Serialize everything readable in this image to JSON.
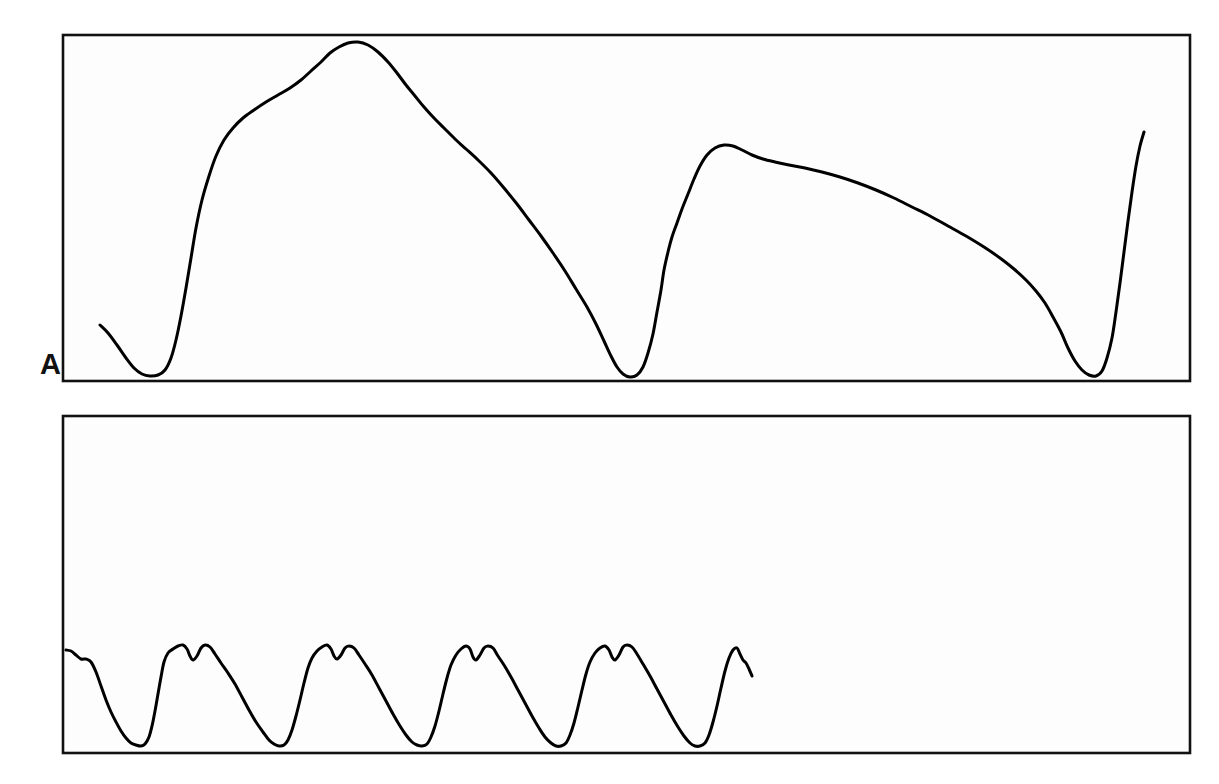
{
  "figure": {
    "kind": "physiological-strip-chart",
    "background_color": "#ffffff",
    "width": 1219,
    "height": 784,
    "grid_minor_color": "#3a3a3a",
    "grid_major_color": "#111111",
    "trace_color": "#000000"
  },
  "panels": [
    {
      "id": "A",
      "label": "A",
      "plot_box": {
        "x": 63,
        "y": 35,
        "width": 1127,
        "height": 346
      },
      "grid": {
        "minor_step_x": 9.4,
        "minor_step_y": 9.6,
        "major_every": 5,
        "minor_cols": 120,
        "minor_rows": 36
      }
    },
    {
      "id": "B",
      "label": "B",
      "plot_box": {
        "x": 63,
        "y": 416,
        "width": 1127,
        "height": 337
      },
      "grid": {
        "minor_step_x": 9.4,
        "minor_step_y": 9.35,
        "major_every": 5,
        "minor_cols": 120,
        "minor_rows": 36
      }
    }
  ],
  "chart_data": {
    "type": "line",
    "title": "",
    "subtitle": "",
    "xlabel": "",
    "ylabel": "",
    "grid": true,
    "legend": "none",
    "panel_labels": [
      "A",
      "B"
    ],
    "charts": [
      {
        "panel": "A",
        "type": "line",
        "name": "Slow low-frequency trace (panel A)",
        "xlim": [
          63,
          1190
        ],
        "ylim": [
          35,
          381
        ],
        "description": "Single continuous slow-wave trace with a low trough near the left, a broad high plateau peak, a deep sharp trough at mid-record, a secondary rounded peak, a long gradual decline, a deep sharp trough near the right, and a steep terminal upstroke.",
        "points": [
          [
            100,
            325
          ],
          [
            108,
            333
          ],
          [
            117,
            345
          ],
          [
            126,
            358
          ],
          [
            134,
            368
          ],
          [
            142,
            374
          ],
          [
            150,
            376
          ],
          [
            158,
            375
          ],
          [
            165,
            370
          ],
          [
            171,
            358
          ],
          [
            176,
            340
          ],
          [
            181,
            316
          ],
          [
            186,
            288
          ],
          [
            191,
            258
          ],
          [
            196,
            228
          ],
          [
            202,
            200
          ],
          [
            209,
            176
          ],
          [
            216,
            156
          ],
          [
            224,
            140
          ],
          [
            233,
            128
          ],
          [
            243,
            118
          ],
          [
            254,
            110
          ],
          [
            266,
            102
          ],
          [
            278,
            95
          ],
          [
            290,
            88
          ],
          [
            301,
            80
          ],
          [
            311,
            71
          ],
          [
            321,
            62
          ],
          [
            330,
            53
          ],
          [
            339,
            47
          ],
          [
            348,
            43
          ],
          [
            358,
            42
          ],
          [
            368,
            45
          ],
          [
            378,
            52
          ],
          [
            388,
            62
          ],
          [
            397,
            73
          ],
          [
            406,
            85
          ],
          [
            415,
            96
          ],
          [
            424,
            107
          ],
          [
            434,
            118
          ],
          [
            444,
            128
          ],
          [
            455,
            139
          ],
          [
            466,
            149
          ],
          [
            478,
            160
          ],
          [
            491,
            173
          ],
          [
            504,
            188
          ],
          [
            517,
            204
          ],
          [
            529,
            220
          ],
          [
            541,
            236
          ],
          [
            553,
            253
          ],
          [
            565,
            271
          ],
          [
            576,
            289
          ],
          [
            587,
            307
          ],
          [
            596,
            324
          ],
          [
            604,
            341
          ],
          [
            611,
            356
          ],
          [
            617,
            367
          ],
          [
            623,
            374
          ],
          [
            630,
            377
          ],
          [
            637,
            375
          ],
          [
            643,
            367
          ],
          [
            648,
            353
          ],
          [
            653,
            334
          ],
          [
            657,
            312
          ],
          [
            661,
            290
          ],
          [
            664,
            270
          ],
          [
            668,
            252
          ],
          [
            672,
            237
          ],
          [
            677,
            223
          ],
          [
            682,
            209
          ],
          [
            688,
            194
          ],
          [
            694,
            179
          ],
          [
            700,
            166
          ],
          [
            707,
            155
          ],
          [
            715,
            148
          ],
          [
            724,
            145
          ],
          [
            733,
            146
          ],
          [
            742,
            150
          ],
          [
            752,
            155
          ],
          [
            763,
            159
          ],
          [
            775,
            162
          ],
          [
            789,
            165
          ],
          [
            805,
            168
          ],
          [
            822,
            172
          ],
          [
            840,
            177
          ],
          [
            858,
            183
          ],
          [
            876,
            190
          ],
          [
            894,
            198
          ],
          [
            912,
            207
          ],
          [
            930,
            216
          ],
          [
            948,
            226
          ],
          [
            966,
            236
          ],
          [
            984,
            247
          ],
          [
            1000,
            258
          ],
          [
            1014,
            269
          ],
          [
            1026,
            280
          ],
          [
            1036,
            291
          ],
          [
            1045,
            303
          ],
          [
            1053,
            317
          ],
          [
            1061,
            332
          ],
          [
            1068,
            348
          ],
          [
            1075,
            361
          ],
          [
            1082,
            370
          ],
          [
            1089,
            375
          ],
          [
            1096,
            376
          ],
          [
            1102,
            371
          ],
          [
            1107,
            358
          ],
          [
            1112,
            338
          ],
          [
            1116,
            312
          ],
          [
            1120,
            283
          ],
          [
            1124,
            252
          ],
          [
            1128,
            221
          ],
          [
            1132,
            192
          ],
          [
            1136,
            166
          ],
          [
            1140,
            146
          ],
          [
            1144,
            132
          ]
        ]
      },
      {
        "panel": "B",
        "type": "line",
        "name": "Fast pulsatile trace (panel B)",
        "xlim": [
          63,
          1190
        ],
        "ylim": [
          416,
          753
        ],
        "description": "Repeating pulsatile waveform, about 9 full cycles, each with a broad twin-peaked (dicrotic-notched) systolic plateau near y=650 and a sharp trough near y=745. Trace stops at roughly x=752 leaving the right third of the grid blank.",
        "cycle_period_px": 77,
        "cycle_count": 9,
        "peak_y": 648,
        "trough_y": 745,
        "trace_end_x": 752,
        "points": [
          [
            66,
            650
          ],
          [
            71,
            651
          ],
          [
            76,
            655
          ],
          [
            81,
            659
          ],
          [
            86,
            659
          ],
          [
            91,
            662
          ],
          [
            96,
            672
          ],
          [
            101,
            686
          ],
          [
            106,
            700
          ],
          [
            111,
            712
          ],
          [
            116,
            722
          ],
          [
            121,
            731
          ],
          [
            126,
            738
          ],
          [
            131,
            743
          ],
          [
            136,
            745
          ],
          [
            141,
            746
          ],
          [
            145,
            744
          ],
          [
            149,
            737
          ],
          [
            152,
            726
          ],
          [
            155,
            711
          ],
          [
            158,
            694
          ],
          [
            161,
            677
          ],
          [
            164,
            662
          ],
          [
            168,
            653
          ],
          [
            173,
            649
          ],
          [
            178,
            646
          ],
          [
            183,
            645
          ],
          [
            187,
            649
          ],
          [
            190,
            656
          ],
          [
            193,
            660
          ],
          [
            197,
            656
          ],
          [
            201,
            648
          ],
          [
            205,
            645
          ],
          [
            210,
            647
          ],
          [
            215,
            654
          ],
          [
            221,
            663
          ],
          [
            228,
            673
          ],
          [
            235,
            684
          ],
          [
            242,
            697
          ],
          [
            249,
            710
          ],
          [
            256,
            722
          ],
          [
            263,
            732
          ],
          [
            269,
            740
          ],
          [
            274,
            744
          ],
          [
            279,
            746
          ],
          [
            284,
            745
          ],
          [
            288,
            740
          ],
          [
            292,
            730
          ],
          [
            296,
            716
          ],
          [
            300,
            700
          ],
          [
            304,
            683
          ],
          [
            308,
            668
          ],
          [
            312,
            658
          ],
          [
            317,
            651
          ],
          [
            322,
            647
          ],
          [
            327,
            645
          ],
          [
            331,
            649
          ],
          [
            334,
            656
          ],
          [
            337,
            659
          ],
          [
            341,
            655
          ],
          [
            345,
            648
          ],
          [
            349,
            646
          ],
          [
            354,
            648
          ],
          [
            359,
            655
          ],
          [
            365,
            664
          ],
          [
            372,
            675
          ],
          [
            379,
            688
          ],
          [
            386,
            701
          ],
          [
            393,
            714
          ],
          [
            400,
            726
          ],
          [
            406,
            735
          ],
          [
            412,
            742
          ],
          [
            417,
            745
          ],
          [
            422,
            746
          ],
          [
            427,
            744
          ],
          [
            431,
            737
          ],
          [
            435,
            726
          ],
          [
            439,
            711
          ],
          [
            443,
            694
          ],
          [
            447,
            678
          ],
          [
            451,
            665
          ],
          [
            456,
            655
          ],
          [
            461,
            649
          ],
          [
            466,
            646
          ],
          [
            470,
            649
          ],
          [
            473,
            657
          ],
          [
            476,
            660
          ],
          [
            480,
            655
          ],
          [
            484,
            648
          ],
          [
            488,
            646
          ],
          [
            493,
            648
          ],
          [
            498,
            656
          ],
          [
            504,
            665
          ],
          [
            511,
            677
          ],
          [
            518,
            690
          ],
          [
            525,
            703
          ],
          [
            532,
            716
          ],
          [
            539,
            728
          ],
          [
            545,
            737
          ],
          [
            551,
            743
          ],
          [
            556,
            746
          ],
          [
            561,
            746
          ],
          [
            566,
            743
          ],
          [
            570,
            735
          ],
          [
            574,
            723
          ],
          [
            578,
            707
          ],
          [
            582,
            690
          ],
          [
            586,
            674
          ],
          [
            590,
            662
          ],
          [
            595,
            653
          ],
          [
            600,
            648
          ],
          [
            605,
            646
          ],
          [
            609,
            650
          ],
          [
            612,
            657
          ],
          [
            615,
            660
          ],
          [
            619,
            655
          ],
          [
            623,
            647
          ],
          [
            627,
            645
          ],
          [
            632,
            647
          ],
          [
            637,
            654
          ],
          [
            643,
            664
          ],
          [
            650,
            676
          ],
          [
            657,
            689
          ],
          [
            664,
            702
          ],
          [
            671,
            715
          ],
          [
            678,
            727
          ],
          [
            684,
            736
          ],
          [
            690,
            743
          ],
          [
            695,
            746
          ],
          [
            700,
            746
          ],
          [
            705,
            743
          ],
          [
            709,
            735
          ],
          [
            713,
            722
          ],
          [
            717,
            706
          ],
          [
            721,
            688
          ],
          [
            725,
            671
          ],
          [
            729,
            658
          ],
          [
            733,
            650
          ],
          [
            737,
            648
          ],
          [
            740,
            654
          ],
          [
            743,
            660
          ],
          [
            746,
            663
          ],
          [
            749,
            669
          ],
          [
            752,
            676
          ]
        ]
      }
    ]
  }
}
